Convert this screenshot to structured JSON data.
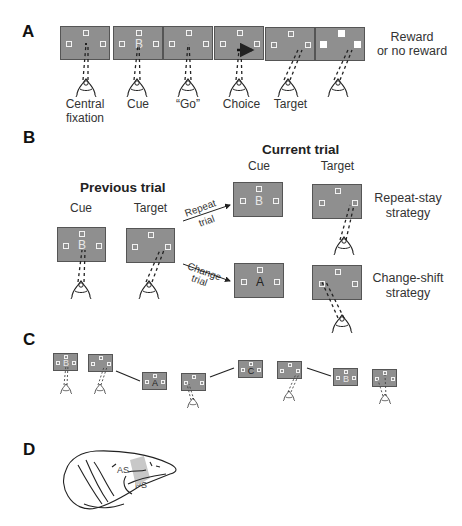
{
  "panels": {
    "A": {
      "label": "A",
      "steps": [
        {
          "name": "central-fixation",
          "caption_line1": "Central",
          "caption_line2": "fixation",
          "letter": ""
        },
        {
          "name": "cue",
          "caption_line1": "Cue",
          "caption_line2": "",
          "letter": "B"
        },
        {
          "name": "go",
          "caption_line1": "“Go”",
          "caption_line2": "",
          "letter": ""
        },
        {
          "name": "choice",
          "caption_line1": "Choice",
          "caption_line2": "",
          "letter": ""
        },
        {
          "name": "target",
          "caption_line1": "Target",
          "caption_line2": "",
          "letter": ""
        },
        {
          "name": "reward",
          "caption_line1": "",
          "caption_line2": "",
          "letter": ""
        }
      ],
      "outcome_line1": "Reward",
      "outcome_line2": "or no reward"
    },
    "B": {
      "label": "B",
      "previous_trial_title": "Previous trial",
      "current_trial_title": "Current trial",
      "prev_cue_label": "Cue",
      "prev_target_label": "Target",
      "prev_cue_letter": "B",
      "curr_cue_label": "Cue",
      "curr_target_label": "Target",
      "repeat_arrow_line1": "Repeat",
      "repeat_arrow_line2": "trial",
      "change_arrow_line1": "Change",
      "change_arrow_line2": "trial",
      "repeat_cue_letter": "B",
      "change_cue_letter": "A",
      "repeat_strategy_line1": "Repeat-stay",
      "repeat_strategy_line2": "strategy",
      "change_strategy_line1": "Change-shift",
      "change_strategy_line2": "strategy"
    },
    "C": {
      "label": "C",
      "sequence_letters": [
        "B",
        "",
        "A",
        "",
        "C",
        "",
        "B",
        ""
      ]
    },
    "D": {
      "label": "D",
      "sulcus_labels": [
        "AS",
        "PS"
      ],
      "highlight_color": "#c8c8c8"
    }
  },
  "colors": {
    "screen_fill": "#8f8f8f",
    "screen_border": "#555555",
    "stimulus_square": "#f2f2f2"
  }
}
